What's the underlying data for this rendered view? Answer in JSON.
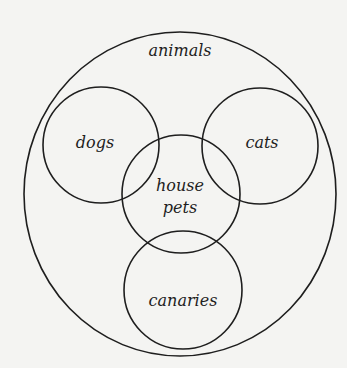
{
  "diagram": {
    "type": "venn-euler",
    "sets": {
      "outer": {
        "label": "animals"
      },
      "dogs": {
        "label": "dogs"
      },
      "cats": {
        "label": "cats"
      },
      "house_pets": {
        "label_line1": "house",
        "label_line2": "pets"
      },
      "canaries": {
        "label": "canaries"
      }
    },
    "colors": {
      "stroke": "#1e1e1e",
      "background": "#f4f4f2"
    }
  }
}
